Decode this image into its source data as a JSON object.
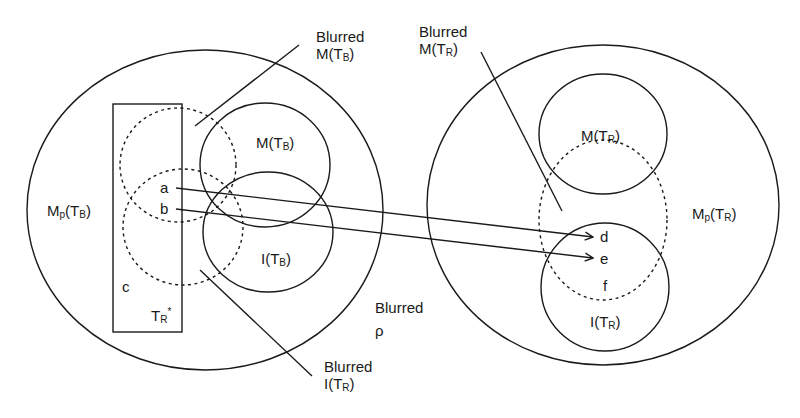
{
  "diagram": {
    "colors": {
      "stroke": "#1a1a1a",
      "background": "#ffffff"
    },
    "left": {
      "outer": {
        "base": "M",
        "sub1": "p",
        "paren_open": "(T",
        "sub2": "B",
        "paren_close": ")"
      },
      "m_circle": {
        "base": "M(T",
        "sub": "B",
        "close": ")"
      },
      "i_circle": {
        "base": "I(T",
        "sub": "B",
        "close": ")"
      },
      "rect": {
        "c": "c",
        "tr_base": "T",
        "tr_sub": "R",
        "tr_star": "*"
      },
      "points": {
        "a": "a",
        "b": "b"
      }
    },
    "right": {
      "outer": {
        "base": "M",
        "sub1": "p",
        "paren_open": "(T",
        "sub2": "R",
        "paren_close": ")"
      },
      "m_circle": {
        "base": "M(T",
        "sub": "R",
        "close": ")"
      },
      "i_circle": {
        "base": "I(T",
        "sub": "R",
        "close": ")"
      },
      "points": {
        "d": "d",
        "e": "e",
        "f": "f"
      }
    },
    "callouts": {
      "blurred_m_tb": {
        "line1": "Blurred",
        "base": "M(T",
        "sub": "B",
        "close": ")"
      },
      "blurred_m_tr": {
        "line1": "Blurred",
        "base": "M(T",
        "sub": "R",
        "close": ")"
      },
      "blurred_i_tr": {
        "line1": "Blurred",
        "base": "I(T",
        "sub": "R",
        "close": ")"
      },
      "blurred_rho": {
        "line1": "Blurred",
        "line2": "ρ"
      }
    },
    "arrows": [
      {
        "from": "a",
        "to": "d"
      },
      {
        "from": "b",
        "to": "e"
      }
    ]
  }
}
